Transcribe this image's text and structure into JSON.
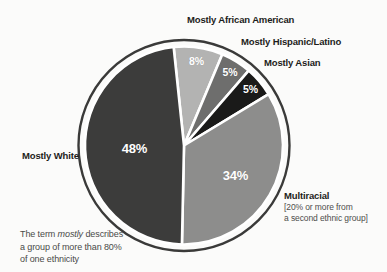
{
  "figure": {
    "background": "#fbfbfa"
  },
  "chart_data": {
    "type": "pie",
    "title": "",
    "start_angle_deg": -6,
    "direction": "clockwise",
    "total": 100,
    "ring_color": "#3a3a39",
    "divider_color": "#ffffff",
    "legend_position": "callouts-around-pie",
    "slices": [
      {
        "label": "Mostly African American",
        "value": 8,
        "pct_label": "8%",
        "color": "#b3b3b2",
        "label_r": 0.86
      },
      {
        "label": "Mostly Hispanic/Latino",
        "value": 5,
        "pct_label": "5%",
        "color": "#6e6e6d",
        "label_r": 0.88
      },
      {
        "label": "Mostly Asian",
        "value": 5,
        "pct_label": "5%",
        "color": "#1a1a19",
        "label_r": 0.88
      },
      {
        "label": "Multiracial",
        "value": 34,
        "pct_label": "34%",
        "color": "#8d8d8c",
        "label_r": 0.6
      },
      {
        "label": "Mostly White",
        "value": 48,
        "pct_label": "48%",
        "color": "#3c3c3b",
        "label_r": 0.5
      }
    ]
  },
  "annotations": {
    "multiracial_note_line1": "[20% or more from",
    "multiracial_note_line2": "a second ethnic group]",
    "footnote_line1_pre": "The term ",
    "footnote_line1_italic": "mostly",
    "footnote_line1_post": " describes",
    "footnote_line2": "a group of more than 80%",
    "footnote_line3": "of one ethnicity"
  }
}
